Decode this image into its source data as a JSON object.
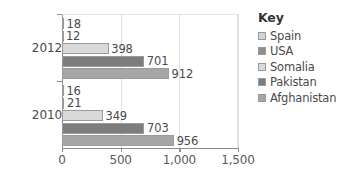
{
  "chart_data": {
    "type": "bar",
    "orientation": "horizontal",
    "title": "",
    "xlabel": "",
    "ylabel": "",
    "categories": [
      "2012",
      "2010"
    ],
    "xlim": [
      0,
      1500
    ],
    "xticks": [
      0,
      500,
      1000,
      1500
    ],
    "xtick_labels": [
      "0",
      "500",
      "1,000",
      "1,500"
    ],
    "grid": true,
    "legend_position": "right",
    "series": [
      {
        "name": "Spain",
        "color": "#d4d4d4",
        "values": [
          18,
          12
        ]
      },
      {
        "name": "USA",
        "color": "#8e8e8e",
        "values": [
          12,
          21
        ]
      },
      {
        "name": "Somalia",
        "color": "#d9d9d9",
        "values": [
          398,
          349
        ]
      },
      {
        "name": "Pakistan",
        "color": "#7d7d7d",
        "values": [
          701,
          703
        ]
      },
      {
        "name": "Afghanistan",
        "color": "#a6a6a6",
        "values": [
          912,
          956
        ]
      }
    ],
    "groups": [
      {
        "category": "2012",
        "bars": [
          {
            "series": "Spain",
            "value": 18,
            "label": "18",
            "color": "#d4d4d4"
          },
          {
            "series": "USA",
            "value": 12,
            "label": "12",
            "color": "#8e8e8e"
          },
          {
            "series": "Somalia",
            "value": 398,
            "label": "398",
            "color": "#d9d9d9"
          },
          {
            "series": "Pakistan",
            "value": 701,
            "label": "701",
            "color": "#7d7d7d"
          },
          {
            "series": "Afghanistan",
            "value": 912,
            "label": "912",
            "color": "#a6a6a6"
          }
        ]
      },
      {
        "category": "2010",
        "bars": [
          {
            "series": "Spain",
            "value": 16,
            "label": "16",
            "color": "#d4d4d4"
          },
          {
            "series": "USA",
            "value": 21,
            "label": "21",
            "color": "#8e8e8e"
          },
          {
            "series": "Somalia",
            "value": 349,
            "label": "349",
            "color": "#d9d9d9"
          },
          {
            "series": "Pakistan",
            "value": 703,
            "label": "703",
            "color": "#7d7d7d"
          },
          {
            "series": "Afghanistan",
            "value": 956,
            "label": "956",
            "color": "#a6a6a6"
          }
        ]
      }
    ]
  },
  "legend": {
    "title": "Key",
    "items": [
      {
        "label": "Spain",
        "color": "#d4d4d4"
      },
      {
        "label": "USA",
        "color": "#8e8e8e"
      },
      {
        "label": "Somalia",
        "color": "#d9d9d9"
      },
      {
        "label": "Pakistan",
        "color": "#7d7d7d"
      },
      {
        "label": "Afghanistan",
        "color": "#a6a6a6"
      }
    ]
  },
  "colors": {
    "axis": "#8c8c8c",
    "grid": "#e0e0e0",
    "text": "#4a4a4a",
    "background": "#ffffff"
  }
}
